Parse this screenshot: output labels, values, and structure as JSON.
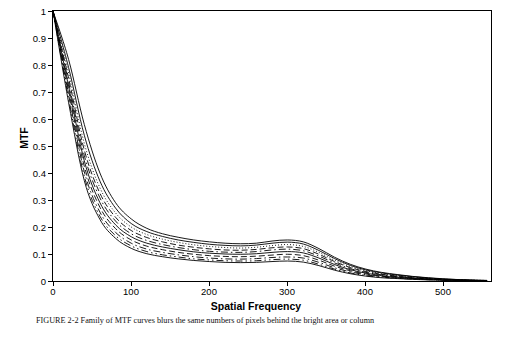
{
  "chart_data": {
    "type": "line",
    "title": "",
    "xlabel": "Spatial Frequency",
    "ylabel": "MTF",
    "xlim": [
      0,
      560
    ],
    "ylim": [
      0,
      1
    ],
    "grid": false,
    "legend": "none",
    "xticks": [
      0,
      100,
      200,
      300,
      400,
      500
    ],
    "yticks": [
      "0",
      "0.1",
      "0.2",
      "0.3",
      "0.4",
      "0.5",
      "0.6",
      "0.7",
      "0.8",
      "0.9",
      "1"
    ],
    "x": [
      0,
      20,
      40,
      60,
      80,
      100,
      120,
      140,
      160,
      180,
      200,
      220,
      240,
      260,
      280,
      300,
      320,
      340,
      360,
      380,
      400,
      420,
      440,
      460,
      480,
      500,
      520,
      540,
      555
    ],
    "series": [
      {
        "name": "curve-1",
        "style": "solid",
        "values": [
          1.0,
          0.82,
          0.58,
          0.4,
          0.29,
          0.23,
          0.195,
          0.175,
          0.162,
          0.152,
          0.145,
          0.14,
          0.138,
          0.14,
          0.148,
          0.152,
          0.145,
          0.12,
          0.088,
          0.062,
          0.044,
          0.032,
          0.024,
          0.017,
          0.012,
          0.008,
          0.005,
          0.003,
          0.002
        ]
      },
      {
        "name": "curve-2",
        "style": "solid",
        "values": [
          1.0,
          0.79,
          0.54,
          0.37,
          0.27,
          0.213,
          0.183,
          0.165,
          0.152,
          0.143,
          0.136,
          0.132,
          0.13,
          0.133,
          0.14,
          0.144,
          0.137,
          0.113,
          0.083,
          0.058,
          0.041,
          0.03,
          0.022,
          0.016,
          0.011,
          0.007,
          0.005,
          0.003,
          0.002
        ]
      },
      {
        "name": "curve-3",
        "style": "dotted",
        "values": [
          1.0,
          0.77,
          0.51,
          0.345,
          0.252,
          0.2,
          0.172,
          0.155,
          0.143,
          0.134,
          0.128,
          0.124,
          0.122,
          0.125,
          0.131,
          0.135,
          0.128,
          0.106,
          0.077,
          0.054,
          0.038,
          0.027,
          0.02,
          0.014,
          0.01,
          0.007,
          0.004,
          0.003,
          0.002
        ]
      },
      {
        "name": "curve-4",
        "style": "dashed",
        "values": [
          1.0,
          0.75,
          0.485,
          0.325,
          0.236,
          0.187,
          0.161,
          0.145,
          0.133,
          0.125,
          0.119,
          0.115,
          0.114,
          0.117,
          0.123,
          0.126,
          0.12,
          0.099,
          0.072,
          0.05,
          0.035,
          0.025,
          0.018,
          0.013,
          0.009,
          0.006,
          0.004,
          0.002,
          0.001
        ]
      },
      {
        "name": "curve-5",
        "style": "dash-dot",
        "values": [
          1.0,
          0.735,
          0.465,
          0.308,
          0.222,
          0.175,
          0.15,
          0.135,
          0.124,
          0.116,
          0.11,
          0.107,
          0.106,
          0.109,
          0.115,
          0.118,
          0.112,
          0.092,
          0.067,
          0.046,
          0.032,
          0.023,
          0.016,
          0.011,
          0.008,
          0.005,
          0.003,
          0.002,
          0.001
        ]
      },
      {
        "name": "curve-6",
        "style": "solid",
        "values": [
          1.0,
          0.72,
          0.445,
          0.29,
          0.208,
          0.164,
          0.14,
          0.126,
          0.116,
          0.108,
          0.103,
          0.1,
          0.099,
          0.101,
          0.106,
          0.109,
          0.104,
          0.085,
          0.061,
          0.042,
          0.029,
          0.02,
          0.014,
          0.01,
          0.007,
          0.004,
          0.003,
          0.002,
          0.001
        ]
      },
      {
        "name": "curve-7",
        "style": "dashed",
        "values": [
          1.0,
          0.705,
          0.425,
          0.273,
          0.194,
          0.152,
          0.129,
          0.116,
          0.106,
          0.099,
          0.094,
          0.091,
          0.09,
          0.092,
          0.096,
          0.099,
          0.094,
          0.077,
          0.055,
          0.038,
          0.026,
          0.018,
          0.013,
          0.009,
          0.006,
          0.004,
          0.002,
          0.001,
          0.001
        ]
      },
      {
        "name": "curve-8",
        "style": "dash-dot",
        "values": [
          1.0,
          0.69,
          0.405,
          0.255,
          0.18,
          0.14,
          0.118,
          0.106,
          0.097,
          0.09,
          0.085,
          0.082,
          0.081,
          0.083,
          0.087,
          0.089,
          0.085,
          0.069,
          0.049,
          0.034,
          0.023,
          0.016,
          0.011,
          0.008,
          0.005,
          0.003,
          0.002,
          0.001,
          0.001
        ]
      },
      {
        "name": "curve-9",
        "style": "dash-dot-dot",
        "values": [
          1.0,
          0.675,
          0.388,
          0.24,
          0.168,
          0.13,
          0.109,
          0.097,
          0.089,
          0.082,
          0.078,
          0.075,
          0.074,
          0.075,
          0.079,
          0.081,
          0.077,
          0.062,
          0.044,
          0.03,
          0.02,
          0.014,
          0.01,
          0.007,
          0.005,
          0.003,
          0.002,
          0.001,
          0.001
        ]
      },
      {
        "name": "curve-10",
        "style": "solid",
        "values": [
          1.0,
          0.66,
          0.372,
          0.228,
          0.158,
          0.121,
          0.101,
          0.09,
          0.082,
          0.076,
          0.072,
          0.069,
          0.068,
          0.069,
          0.072,
          0.074,
          0.07,
          0.057,
          0.04,
          0.027,
          0.018,
          0.012,
          0.009,
          0.006,
          0.004,
          0.003,
          0.002,
          0.001,
          0.0
        ]
      }
    ]
  },
  "axes": {
    "x_title": "Spatial Frequency",
    "y_title": "MTF",
    "x_ticks": [
      "0",
      "100",
      "200",
      "300",
      "400",
      "500"
    ],
    "y_ticks": [
      "0",
      "0.1",
      "0.2",
      "0.3",
      "0.4",
      "0.5",
      "0.6",
      "0.7",
      "0.8",
      "0.9",
      "1"
    ]
  },
  "caption": {
    "text": "FIGURE 2-2 Family of MTF curves blurs the same numbers of pixels behind the bright area or column"
  },
  "colors": {
    "line": "#000000",
    "axis": "#000000",
    "background": "#ffffff"
  }
}
